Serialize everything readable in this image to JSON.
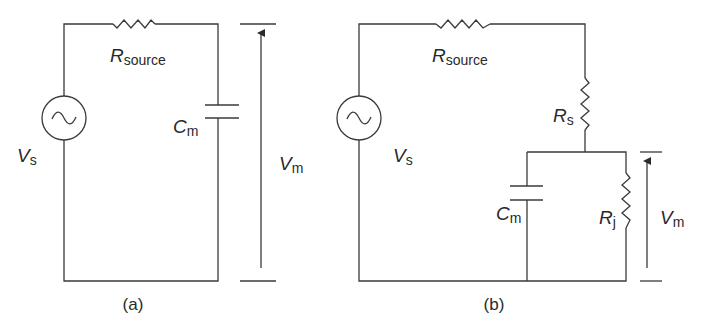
{
  "figure": {
    "panels": [
      {
        "id": "a",
        "caption": "(a)",
        "labels": {
          "source_resistor": {
            "main": "R",
            "sub": "source"
          },
          "voltage_source": {
            "main": "V",
            "sub": "s"
          },
          "capacitor": {
            "main": "C",
            "sub": "m"
          },
          "measured_voltage": {
            "main": "V",
            "sub": "m"
          }
        },
        "components": [
          "AC voltage source V_s",
          "series resistor R_source",
          "capacitor C_m"
        ],
        "measurement": "V_m measured across C_m (full height of circuit)"
      },
      {
        "id": "b",
        "caption": "(b)",
        "labels": {
          "source_resistor": {
            "main": "R",
            "sub": "source"
          },
          "voltage_source": {
            "main": "V",
            "sub": "s"
          },
          "series_resistor": {
            "main": "R",
            "sub": "s"
          },
          "capacitor": {
            "main": "C",
            "sub": "m"
          },
          "parallel_resistor": {
            "main": "R",
            "sub": "j"
          },
          "measured_voltage": {
            "main": "V",
            "sub": "m"
          }
        },
        "components": [
          "AC voltage source V_s",
          "series resistor R_source",
          "series resistor R_s",
          "capacitor C_m in parallel with resistor R_j"
        ],
        "measurement": "V_m measured across the parallel C_m || R_j network"
      }
    ],
    "colors": {
      "line": "#3a3a3a",
      "text": "#2a2a2a",
      "background": "#ffffff"
    }
  }
}
